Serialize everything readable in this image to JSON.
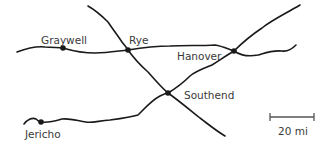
{
  "map": {
    "towns": [
      {
        "name": "Graywell",
        "x": 63,
        "y": 48
      },
      {
        "name": "Rye",
        "x": 128,
        "y": 50
      },
      {
        "name": "Hanover",
        "x": 234,
        "y": 51
      },
      {
        "name": "Southend",
        "x": 168,
        "y": 93
      },
      {
        "name": "Jericho",
        "x": 41,
        "y": 122
      }
    ],
    "scale": {
      "label": "20 mi"
    },
    "colors": {
      "road": "#1a1a1a",
      "label": "#3a3a3a"
    }
  }
}
